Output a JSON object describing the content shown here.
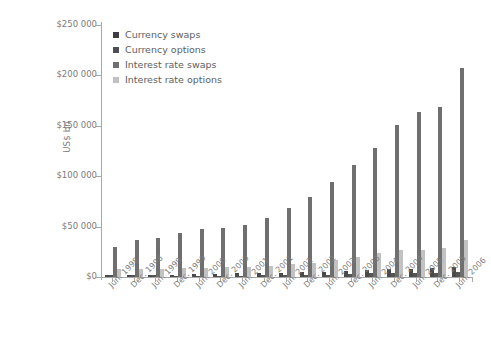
{
  "chart_data": {
    "type": "bar",
    "title": "",
    "subtitle": "",
    "xlabel": "",
    "ylabel": "US$ bn",
    "ylim": [
      0,
      250000
    ],
    "ytick_values": [
      0,
      50000,
      100000,
      150000,
      200000,
      250000
    ],
    "ytick_labels": [
      "$0",
      "$50 000",
      "$100 000",
      "$150 000",
      "$200 000",
      "$250 000"
    ],
    "grid": false,
    "legend_position": "top-left",
    "categories": [
      "Jun. 1998",
      "Dec. 1998",
      "Jun. 1999",
      "Dec. 1999",
      "Jun. 2000",
      "Dec. 2000",
      "Jun. 2001",
      "Dec. 2001",
      "Jun. 2002",
      "Dec. 2002",
      "Jun. 2003",
      "Dec. 2003",
      "Jun. 2004",
      "Dec. 2004",
      "Jun. 2005",
      "Dec. 2005",
      "Jun. 2006"
    ],
    "series": [
      {
        "name": "Currency swaps",
        "color": "#4a4a4a",
        "values": [
          2253,
          2253,
          2350,
          2444,
          2605,
          3194,
          3832,
          3942,
          4215,
          4503,
          5159,
          6371,
          7033,
          8223,
          8236,
          8504,
          9669
        ]
      },
      {
        "name": "Currency options",
        "color": "#555555",
        "values": [
          1947,
          1904,
          2027,
          975,
          1335,
          1365,
          1449,
          1577,
          1993,
          2039,
          2470,
          3180,
          3765,
          4062,
          4337,
          4273,
          5105
        ]
      },
      {
        "name": "Interest rate swaps",
        "color": "#6f6f6f",
        "values": [
          29363,
          36262,
          38372,
          43936,
          47993,
          48768,
          51407,
          58897,
          68274,
          79120,
          94583,
          111209,
          127570,
          150631,
          163749,
          169106,
          207588
        ]
      },
      {
        "name": "Interest rate options",
        "color": "#c2c2c2",
        "values": [
          7997,
          7997,
          7926,
          9380,
          9361,
          9476,
          10033,
          10879,
          12575,
          13746,
          17268,
          20012,
          23912,
          27082,
          27079,
          28596,
          36856
        ]
      }
    ]
  },
  "legend": {
    "items": [
      {
        "label": "Currency swaps"
      },
      {
        "label": "Currency options"
      },
      {
        "label": "Interest rate swaps"
      },
      {
        "label": "Interest rate options"
      }
    ]
  }
}
